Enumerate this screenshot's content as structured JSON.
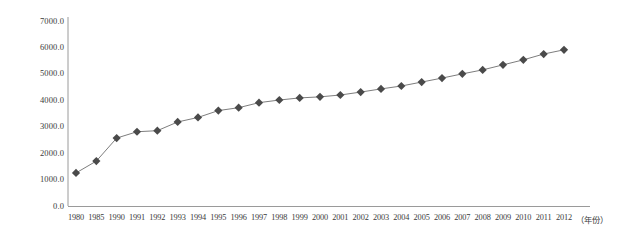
{
  "chart_data": {
    "type": "line",
    "title": "",
    "subtitle": "",
    "xlabel": "（年份）",
    "ylabel": "",
    "categories": [
      "1980",
      "1985",
      "1990",
      "1991",
      "1992",
      "1993",
      "1994",
      "1995",
      "1996",
      "1997",
      "1998",
      "1999",
      "2000",
      "2001",
      "2002",
      "2003",
      "2004",
      "2005",
      "2006",
      "2007",
      "2008",
      "2009",
      "2010",
      "2011",
      "2012"
    ],
    "values": [
      1250,
      1700,
      2570,
      2810,
      2850,
      3180,
      3350,
      3610,
      3720,
      3910,
      4010,
      4090,
      4130,
      4200,
      4310,
      4430,
      4540,
      4690,
      4840,
      5000,
      5150,
      5340,
      5530,
      5750,
      5910
    ],
    "series": [
      {
        "name": "",
        "values": [
          1250,
          1700,
          2570,
          2810,
          2850,
          3180,
          3350,
          3610,
          3720,
          3910,
          4010,
          4090,
          4130,
          4200,
          4310,
          4430,
          4540,
          4690,
          4840,
          5000,
          5150,
          5340,
          5530,
          5750,
          5910
        ]
      }
    ],
    "ylim": [
      0,
      7000
    ],
    "ytick_labels": [
      "7000.0",
      "6000.0",
      "5000.0",
      "4000.0",
      "3000.0",
      "2000.0",
      "1000.0",
      "0.0"
    ],
    "ytick_values": [
      7000,
      6000,
      5000,
      4000,
      3000,
      2000,
      1000,
      0
    ],
    "grid": false,
    "legend": "none",
    "marker": "diamond",
    "marker_color": "#4a4a4a",
    "line_color": "#6e6e6e",
    "axis_color": "#9a9a9a",
    "background": "#ffffff"
  }
}
